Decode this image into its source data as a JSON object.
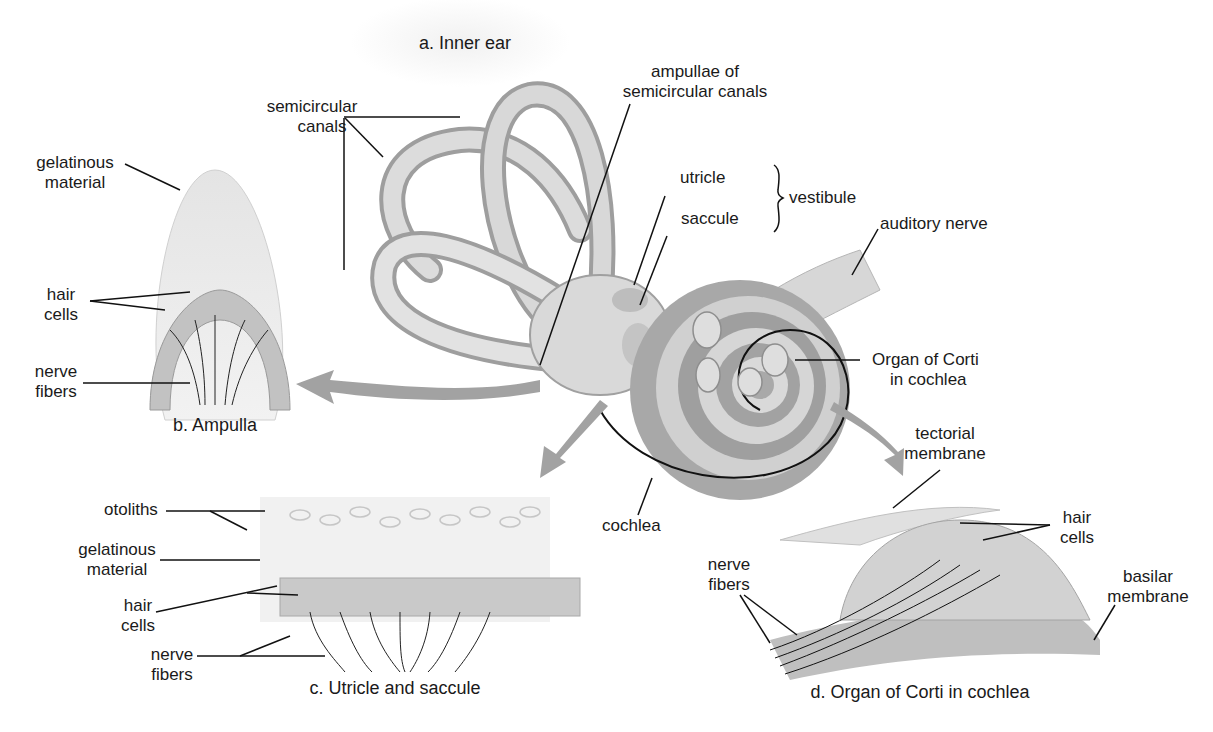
{
  "figure": {
    "panels": [
      {
        "id": "a",
        "caption": "a. Inner ear"
      },
      {
        "id": "b",
        "caption": "b. Ampulla"
      },
      {
        "id": "c",
        "caption": "c. Utricle and saccule"
      },
      {
        "id": "d",
        "caption": "d. Organ of Corti in cochlea"
      }
    ],
    "inner_ear_labels": {
      "semicircular_canals": [
        "semicircular",
        "canals"
      ],
      "ampullae": [
        "ampullae of",
        "semicircular canals"
      ],
      "utricle": "utricle",
      "saccule": "saccule",
      "vestibule": "vestibule",
      "auditory_nerve": "auditory nerve",
      "organ_of_corti": [
        "Organ of Corti",
        "in cochlea"
      ],
      "cochlea": "cochlea"
    },
    "ampulla_labels": {
      "gelatinous_material": [
        "gelatinous",
        "material"
      ],
      "hair_cells": [
        "hair",
        "cells"
      ],
      "nerve_fibers": [
        "nerve",
        "fibers"
      ]
    },
    "utricle_saccule_labels": {
      "otoliths": "otoliths",
      "gelatinous_material": [
        "gelatinous",
        "material"
      ],
      "hair_cells": [
        "hair",
        "cells"
      ],
      "nerve_fibers": [
        "nerve",
        "fibers"
      ]
    },
    "corti_labels": {
      "tectorial_membrane": [
        "tectorial",
        "membrane"
      ],
      "hair_cells": [
        "hair",
        "cells"
      ],
      "nerve_fibers": [
        "nerve",
        "fibers"
      ],
      "basilar_membrane": [
        "basilar",
        "membrane"
      ]
    },
    "colors": {
      "tissue_light": "#e6e6e6",
      "tissue_mid": "#bdbdbd",
      "tissue_dark": "#8c8c8c",
      "arrow": "#9a9a9a",
      "leader": "#111111"
    }
  }
}
